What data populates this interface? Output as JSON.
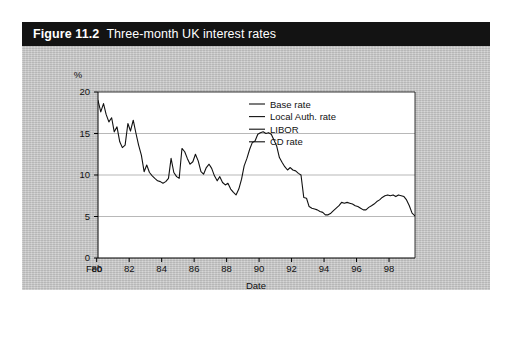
{
  "figure": {
    "number_label": "Figure 11.2",
    "title": "Three-month UK interest rates"
  },
  "colors": {
    "header_background": "#131313",
    "header_text": "#ffffff",
    "panel_background": "#c9c9c9",
    "plot_background": "#ffffff",
    "axis": "#000000",
    "gridline": "#9a9a9a",
    "series_line": "#111111"
  },
  "chart_data": {
    "type": "line",
    "title": "Three-month UK interest rates",
    "xlabel": "Date",
    "ylabel": "%",
    "ylim": [
      0,
      20
    ],
    "yticks": [
      0,
      5,
      10,
      15,
      20
    ],
    "ytick_labels": [
      "0",
      "5",
      "10",
      "15",
      "20"
    ],
    "xlim": [
      1980.08,
      1999.6
    ],
    "xticks": [
      1980,
      1982,
      1984,
      1986,
      1988,
      1990,
      1992,
      1994,
      1996,
      1998
    ],
    "xtick_labels": [
      "80",
      "82",
      "84",
      "86",
      "88",
      "90",
      "92",
      "94",
      "96",
      "98"
    ],
    "xtick_prefix": "Feb",
    "grid": true,
    "grid_axis": "y",
    "legend_position": "top-right",
    "legend": [
      "Base rate",
      "Local Auth. rate",
      "LIBOR",
      "CD rate"
    ],
    "series": [
      {
        "name": "LIBOR",
        "x": [
          1980.08,
          1980.25,
          1980.42,
          1980.58,
          1980.75,
          1980.92,
          1981.08,
          1981.25,
          1981.42,
          1981.58,
          1981.75,
          1981.92,
          1982.08,
          1982.25,
          1982.42,
          1982.58,
          1982.75,
          1982.92,
          1983.08,
          1983.25,
          1983.42,
          1983.58,
          1983.75,
          1983.92,
          1984.08,
          1984.25,
          1984.42,
          1984.58,
          1984.75,
          1984.92,
          1985.08,
          1985.25,
          1985.42,
          1985.58,
          1985.75,
          1985.92,
          1986.08,
          1986.25,
          1986.42,
          1986.58,
          1986.75,
          1986.92,
          1987.08,
          1987.25,
          1987.42,
          1987.58,
          1987.75,
          1987.92,
          1988.08,
          1988.25,
          1988.42,
          1988.58,
          1988.75,
          1988.92,
          1989.08,
          1989.25,
          1989.42,
          1989.58,
          1989.75,
          1989.92,
          1990.08,
          1990.25,
          1990.42,
          1990.58,
          1990.75,
          1990.92,
          1991.08,
          1991.25,
          1991.42,
          1991.58,
          1991.75,
          1991.92,
          1992.08,
          1992.25,
          1992.42,
          1992.58,
          1992.75,
          1992.92,
          1993.08,
          1993.25,
          1993.42,
          1993.58,
          1993.75,
          1993.92,
          1994.08,
          1994.25,
          1994.42,
          1994.58,
          1994.75,
          1994.92,
          1995.08,
          1995.25,
          1995.42,
          1995.58,
          1995.75,
          1995.92,
          1996.08,
          1996.25,
          1996.42,
          1996.58,
          1996.75,
          1996.92,
          1997.08,
          1997.25,
          1997.42,
          1997.58,
          1997.75,
          1997.92,
          1998.08,
          1998.25,
          1998.42,
          1998.58,
          1998.75,
          1998.92,
          1999.08,
          1999.25,
          1999.42,
          1999.58
        ],
        "values": [
          19.0,
          17.6,
          18.6,
          17.3,
          16.4,
          16.9,
          15.2,
          15.8,
          14.0,
          13.3,
          13.6,
          16.2,
          15.3,
          16.6,
          15.0,
          13.6,
          12.4,
          10.4,
          11.2,
          10.3,
          9.9,
          9.6,
          9.3,
          9.2,
          9.0,
          9.2,
          9.6,
          12.0,
          10.3,
          9.8,
          9.6,
          13.2,
          12.8,
          12.0,
          11.3,
          11.6,
          12.5,
          11.7,
          10.4,
          10.1,
          10.9,
          11.3,
          10.8,
          9.9,
          9.3,
          9.8,
          9.1,
          8.8,
          9.0,
          8.3,
          7.9,
          7.6,
          8.3,
          9.5,
          11.1,
          12.0,
          13.1,
          13.9,
          14.1,
          14.9,
          15.1,
          15.2,
          15.0,
          15.1,
          14.9,
          14.2,
          13.5,
          12.1,
          11.5,
          11.0,
          10.6,
          10.9,
          10.6,
          10.5,
          10.2,
          10.0,
          7.3,
          7.2,
          6.2,
          6.0,
          5.9,
          5.8,
          5.6,
          5.5,
          5.2,
          5.2,
          5.4,
          5.7,
          6.0,
          6.3,
          6.7,
          6.6,
          6.7,
          6.6,
          6.5,
          6.3,
          6.2,
          6.0,
          5.8,
          5.8,
          6.1,
          6.3,
          6.5,
          6.8,
          7.0,
          7.3,
          7.5,
          7.6,
          7.5,
          7.6,
          7.4,
          7.6,
          7.5,
          7.4,
          7.0,
          6.3,
          5.4,
          5.1
        ]
      }
    ]
  }
}
